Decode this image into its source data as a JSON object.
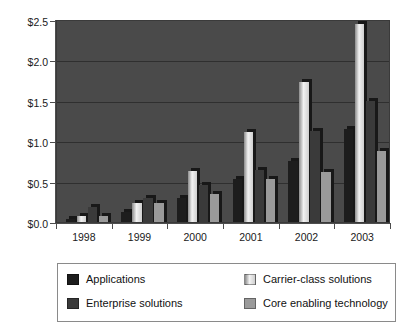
{
  "chart_data": {
    "type": "bar",
    "title": "",
    "subtitle": "",
    "xlabel": "",
    "ylabel": "",
    "categories": [
      "1998",
      "1999",
      "2000",
      "2001",
      "2002",
      "2003"
    ],
    "ylim": [
      0.0,
      2.5
    ],
    "ytick_values": [
      0.0,
      0.5,
      1.0,
      1.5,
      2.0,
      2.5
    ],
    "ytick_labels": [
      "$0.0",
      "$0.5",
      "$1.0",
      "$1.5",
      "$2.0",
      "$2.5"
    ],
    "grid": true,
    "grid_axis": "y",
    "legend_position": "bottom",
    "series": [
      {
        "name": "Applications",
        "color": "#1d1d1d",
        "values": [
          0.04,
          0.12,
          0.29,
          0.53,
          0.75,
          1.15
        ]
      },
      {
        "name": "Enterprise solutions",
        "color": "#e0e0e0",
        "values": [
          0.07,
          0.23,
          0.63,
          1.11,
          1.72,
          2.44
        ]
      },
      {
        "name": "Carrier-class solutions",
        "color": "#3a3a3a",
        "values": [
          0.19,
          0.3,
          0.46,
          0.64,
          1.12,
          1.49
        ]
      },
      {
        "name": "Core enabling technology",
        "color": "#9a9a9a",
        "values": [
          0.08,
          0.23,
          0.34,
          0.53,
          0.61,
          0.87
        ]
      }
    ],
    "plot_background": "#4a4a4a",
    "figure_background": "#ffffff"
  },
  "legend": {
    "items": [
      {
        "label": "Applications",
        "swatch": "legend-swatch-applications"
      },
      {
        "label": "Enterprise solutions",
        "swatch": "legend-swatch-enterprise"
      },
      {
        "label": "Carrier-class solutions",
        "swatch": "legend-swatch-carrier"
      },
      {
        "label": "Core enabling technology",
        "swatch": "legend-swatch-core"
      }
    ]
  }
}
